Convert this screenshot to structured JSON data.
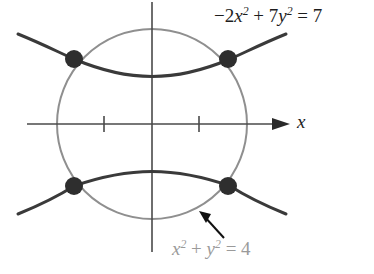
{
  "figure": {
    "background_color": "#ffffff",
    "width": 374,
    "height": 274
  },
  "axes": {
    "x_axis_label": "x",
    "origin_px": [
      152,
      124
    ],
    "pixels_per_unit": 47.5,
    "x_axis_has_arrow": true,
    "y_axis_has_arrow": false,
    "tick_marks": [
      {
        "name": "tick-x-negative-one",
        "value": -1,
        "x_px": 104
      },
      {
        "name": "tick-x-positive-one",
        "value": 1,
        "x_px": 199
      }
    ],
    "axis_color": "#4a4a4a"
  },
  "curves": {
    "circle": {
      "name": "circle",
      "equation_parts": {
        "x_base": "x",
        "x_exponent": "2",
        "plus": " + ",
        "y_base": "y",
        "y_exponent": "2",
        "equals": " = 4"
      },
      "equation_text": "x² + y² = 4",
      "color": "#8f8f8f",
      "radius_units": 2,
      "center": [
        0,
        0
      ],
      "stroke_width": 2
    },
    "hyperbola": {
      "name": "hyperbola",
      "equation_parts": {
        "lead": "−2",
        "x_base": "x",
        "x_exponent": "2",
        "plus": " + 7",
        "y_base": "y",
        "y_exponent": "2",
        "equals": " = 7"
      },
      "equation_text": "−2x² + 7y² = 7",
      "color": "#3a3a3a",
      "vertices_units": [
        [
          0,
          1
        ],
        [
          0,
          -1
        ]
      ],
      "stroke_width": 3
    }
  },
  "intersection_points": {
    "dot_color": "#2e2e2e",
    "dot_radius_px": 9,
    "points": [
      {
        "name": "intersection-top-left",
        "px": [
          74,
          59
        ]
      },
      {
        "name": "intersection-top-right",
        "px": [
          228,
          59
        ]
      },
      {
        "name": "intersection-bottom-left",
        "px": [
          74,
          186
        ]
      },
      {
        "name": "intersection-bottom-right",
        "px": [
          228,
          186
        ]
      }
    ]
  },
  "annotation_arrow": {
    "name": "circle-callout-arrow",
    "color": "#111111",
    "from_px": [
      224,
      239
    ],
    "to_px": [
      200,
      212
    ]
  }
}
